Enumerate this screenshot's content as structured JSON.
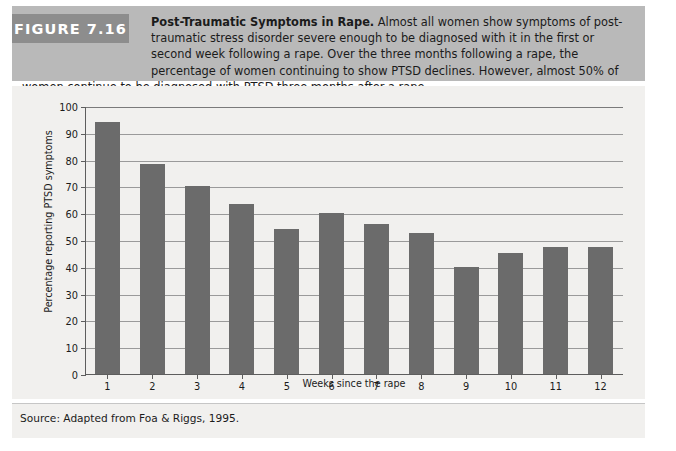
{
  "figure": {
    "tag": "FIGURE 7.16",
    "title": "Post-Traumatic Symptoms in Rape.",
    "caption_rest": " Almost all women show symptoms of post-traumatic stress disorder severe enough to be diagnosed with it in the first or second week following a rape. Over the three months following a rape, the percentage of women continuing to show PTSD declines. However, almost 50% of women continue to be diagnosed with PTSD three months after a rape.",
    "source": "Source: Adapted from Foa & Riggs, 1995."
  },
  "colors": {
    "caption_band": "#b9b9b9",
    "tag_box": "#8d8d8d",
    "plot_background": "#f1f0ee",
    "bar": "#6b6b6b",
    "gridline": "#9a9a9a",
    "axis": "#5d5d5d",
    "page": "#ffffff"
  },
  "chart_data": {
    "type": "bar",
    "title": "Post-Traumatic Symptoms in Rape",
    "xlabel": "Weeks since the rape",
    "ylabel": "Percentage reporting PTSD symptoms",
    "categories": [
      "1",
      "2",
      "3",
      "4",
      "5",
      "6",
      "7",
      "8",
      "9",
      "10",
      "11",
      "12"
    ],
    "values": [
      94,
      78.5,
      70,
      63.5,
      54,
      60,
      56,
      52.5,
      40,
      45,
      47.5,
      47.5
    ],
    "ylim": [
      0,
      100
    ],
    "yticks": [
      0,
      10,
      20,
      30,
      40,
      50,
      60,
      70,
      80,
      90,
      100
    ],
    "ytick_labels": [
      "0",
      "10",
      "20",
      "30",
      "40",
      "50",
      "60",
      "70",
      "80",
      "90",
      "100"
    ],
    "grid": true,
    "legend": "none",
    "bar_color": "#6b6b6b"
  }
}
